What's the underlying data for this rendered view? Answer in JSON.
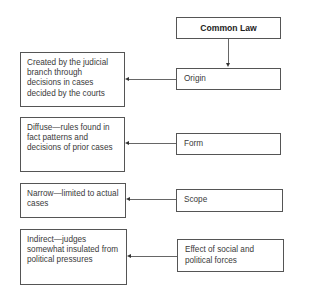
{
  "diagram": {
    "root": {
      "label": "Common Law"
    },
    "rows": [
      {
        "category": "Origin",
        "description": "Created by the judicial branch through decisions in cases decided by the courts"
      },
      {
        "category": "Form",
        "description": "Diffuse—rules found in fact patterns and decisions of prior cases"
      },
      {
        "category": "Scope",
        "description": "Narrow—limited to actual cases"
      },
      {
        "category": "Effect of social and political forces",
        "description": "Indirect—judges somewhat insulated from political pressures"
      }
    ]
  }
}
